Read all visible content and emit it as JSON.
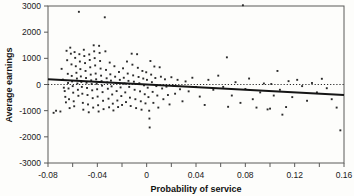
{
  "chart_data": {
    "type": "scatter",
    "title": "",
    "xlabel": "Probability of service",
    "ylabel": "Average earnings",
    "xlim": [
      -0.08,
      0.16
    ],
    "ylim": [
      -3000,
      3000
    ],
    "grid": false,
    "legend": "none",
    "x_ticks": [
      -0.08,
      -0.04,
      0,
      0.04,
      0.08,
      0.12,
      0.16
    ],
    "x_tick_labels": [
      "-0.08",
      "-0.04",
      "0",
      "0.04",
      "0.08",
      "0.12",
      "0.16"
    ],
    "x_minor_ticks": [
      -0.06,
      -0.02,
      0.02,
      0.06,
      0.1,
      0.14
    ],
    "y_ticks": [
      -3000,
      -2000,
      -1000,
      0,
      1000,
      2000,
      3000
    ],
    "y_tick_labels": [
      "-3000",
      "-2000",
      "-1000",
      "0",
      "1000",
      "2000",
      "3000"
    ],
    "annotations": [
      {
        "name": "zero-reference-line",
        "type": "hline",
        "y": 0,
        "style": "dotted"
      },
      {
        "name": "regression-line",
        "type": "line",
        "x0": -0.08,
        "y0": 200,
        "x1": 0.16,
        "y1": -400,
        "style": "solid"
      }
    ],
    "series": [
      {
        "name": "earnings-vs-probability",
        "marker": "point",
        "points": [
          [
            -0.0755,
            -1080
          ],
          [
            -0.0735,
            -1000
          ],
          [
            -0.07,
            -1030
          ],
          [
            -0.069,
            600
          ],
          [
            -0.068,
            190
          ],
          [
            -0.0672,
            -120
          ],
          [
            -0.0665,
            -250
          ],
          [
            -0.066,
            -470
          ],
          [
            -0.0655,
            -680
          ],
          [
            -0.065,
            1290
          ],
          [
            -0.0645,
            930
          ],
          [
            -0.064,
            410
          ],
          [
            -0.0638,
            60
          ],
          [
            -0.0634,
            -150
          ],
          [
            -0.063,
            -560
          ],
          [
            -0.0625,
            -900
          ],
          [
            -0.062,
            1410
          ],
          [
            -0.0615,
            1180
          ],
          [
            -0.061,
            770
          ],
          [
            -0.0608,
            330
          ],
          [
            -0.0605,
            120
          ],
          [
            -0.06,
            -60
          ],
          [
            -0.0596,
            -310
          ],
          [
            -0.0592,
            -640
          ],
          [
            -0.0588,
            -830
          ],
          [
            -0.0585,
            1240
          ],
          [
            -0.058,
            1020
          ],
          [
            -0.0575,
            700
          ],
          [
            -0.057,
            450
          ],
          [
            -0.0566,
            230
          ],
          [
            -0.0562,
            40
          ],
          [
            -0.0558,
            -200
          ],
          [
            -0.0554,
            -430
          ],
          [
            -0.055,
            2780
          ],
          [
            -0.0546,
            1160
          ],
          [
            -0.0542,
            880
          ],
          [
            -0.0538,
            590
          ],
          [
            -0.0534,
            310
          ],
          [
            -0.053,
            100
          ],
          [
            -0.0526,
            -90
          ],
          [
            -0.0522,
            -350
          ],
          [
            -0.0518,
            -700
          ],
          [
            -0.0514,
            -960
          ],
          [
            -0.051,
            1330
          ],
          [
            -0.0506,
            1090
          ],
          [
            -0.05,
            820
          ],
          [
            -0.0496,
            520
          ],
          [
            -0.0492,
            250
          ],
          [
            -0.0488,
            70
          ],
          [
            -0.0484,
            -130
          ],
          [
            -0.048,
            -400
          ],
          [
            -0.0476,
            -760
          ],
          [
            -0.047,
            -1060
          ],
          [
            -0.0466,
            1150
          ],
          [
            -0.0462,
            940
          ],
          [
            -0.0458,
            660
          ],
          [
            -0.0454,
            380
          ],
          [
            -0.045,
            160
          ],
          [
            -0.0446,
            20
          ],
          [
            -0.0442,
            -220
          ],
          [
            -0.0438,
            -520
          ],
          [
            -0.0434,
            -880
          ],
          [
            -0.043,
            1500
          ],
          [
            -0.0426,
            1270
          ],
          [
            -0.0422,
            1010
          ],
          [
            -0.0418,
            730
          ],
          [
            -0.0414,
            420
          ],
          [
            -0.041,
            200
          ],
          [
            -0.0406,
            30
          ],
          [
            -0.0402,
            -180
          ],
          [
            -0.0398,
            -460
          ],
          [
            -0.0394,
            -790
          ],
          [
            -0.039,
            -1030
          ],
          [
            -0.0386,
            1480
          ],
          [
            -0.0382,
            1210
          ],
          [
            -0.0378,
            900
          ],
          [
            -0.0374,
            610
          ],
          [
            -0.037,
            340
          ],
          [
            -0.0366,
            130
          ],
          [
            -0.0362,
            -40
          ],
          [
            -0.0358,
            -290
          ],
          [
            -0.0354,
            -620
          ],
          [
            -0.035,
            -940
          ],
          [
            -0.034,
            2570
          ],
          [
            -0.0335,
            1270
          ],
          [
            -0.033,
            560
          ],
          [
            -0.0325,
            240
          ],
          [
            -0.032,
            80
          ],
          [
            -0.0315,
            -160
          ],
          [
            -0.031,
            -540
          ],
          [
            -0.0305,
            -870
          ],
          [
            -0.03,
            840
          ],
          [
            -0.0295,
            390
          ],
          [
            -0.029,
            150
          ],
          [
            -0.0285,
            -70
          ],
          [
            -0.028,
            -380
          ],
          [
            -0.0275,
            -730
          ],
          [
            -0.027,
            -990
          ],
          [
            -0.0262,
            700
          ],
          [
            -0.0256,
            300
          ],
          [
            -0.025,
            60
          ],
          [
            -0.0244,
            -250
          ],
          [
            -0.0238,
            -610
          ],
          [
            -0.0232,
            -860
          ],
          [
            -0.0225,
            480
          ],
          [
            -0.0218,
            180
          ],
          [
            -0.0212,
            -110
          ],
          [
            -0.0206,
            -440
          ],
          [
            -0.02,
            -780
          ],
          [
            -0.0192,
            620
          ],
          [
            -0.0186,
            260
          ],
          [
            -0.018,
            40
          ],
          [
            -0.0174,
            -300
          ],
          [
            -0.0168,
            -670
          ],
          [
            -0.016,
            880
          ],
          [
            -0.0154,
            420
          ],
          [
            -0.0148,
            140
          ],
          [
            -0.0142,
            -90
          ],
          [
            -0.0136,
            -500
          ],
          [
            -0.013,
            -820
          ],
          [
            -0.0122,
            1180
          ],
          [
            -0.0116,
            760
          ],
          [
            -0.011,
            350
          ],
          [
            -0.0104,
            110
          ],
          [
            -0.0098,
            -200
          ],
          [
            -0.0092,
            -560
          ],
          [
            -0.0086,
            -900
          ],
          [
            -0.0078,
            1160
          ],
          [
            -0.0072,
            640
          ],
          [
            -0.0066,
            290
          ],
          [
            -0.006,
            50
          ],
          [
            -0.0054,
            -260
          ],
          [
            -0.0048,
            -640
          ],
          [
            -0.0042,
            -960
          ],
          [
            -0.0035,
            520
          ],
          [
            -0.0028,
            230
          ],
          [
            -0.0022,
            -30
          ],
          [
            -0.0016,
            -370
          ],
          [
            -0.001,
            -720
          ],
          [
            -0.0004,
            470
          ],
          [
            0.0002,
            180
          ],
          [
            0.0008,
            -120
          ],
          [
            0.0014,
            -480
          ],
          [
            0.002,
            -1000
          ],
          [
            0.0022,
            -1300
          ],
          [
            0.0024,
            -1640
          ],
          [
            0.003,
            900
          ],
          [
            0.0036,
            380
          ],
          [
            0.0042,
            90
          ],
          [
            0.0048,
            -280
          ],
          [
            0.0054,
            -700
          ],
          [
            0.0062,
            690
          ],
          [
            0.007,
            250
          ],
          [
            0.0078,
            -60
          ],
          [
            0.0086,
            -420
          ],
          [
            0.0094,
            -880
          ],
          [
            0.0105,
            660
          ],
          [
            0.0115,
            300
          ],
          [
            0.0125,
            -150
          ],
          [
            0.0135,
            -560
          ],
          [
            0.0148,
            200
          ],
          [
            0.016,
            -80
          ],
          [
            0.0172,
            -400
          ],
          [
            0.0185,
            -760
          ],
          [
            0.02,
            280
          ],
          [
            0.0215,
            -40
          ],
          [
            0.023,
            -350
          ],
          [
            0.025,
            180
          ],
          [
            0.027,
            -180
          ],
          [
            0.029,
            -640
          ],
          [
            0.0315,
            120
          ],
          [
            0.034,
            -260
          ],
          [
            0.037,
            260
          ],
          [
            0.04,
            -90
          ],
          [
            0.043,
            -460
          ],
          [
            0.047,
            -780
          ],
          [
            0.05,
            180
          ],
          [
            0.054,
            -200
          ],
          [
            0.058,
            340
          ],
          [
            0.062,
            -90
          ],
          [
            0.065,
            1040
          ],
          [
            0.066,
            -850
          ],
          [
            0.069,
            -420
          ],
          [
            0.072,
            90
          ],
          [
            0.076,
            -700
          ],
          [
            0.078,
            3030
          ],
          [
            0.08,
            -170
          ],
          [
            0.083,
            230
          ],
          [
            0.086,
            -560
          ],
          [
            0.089,
            -880
          ],
          [
            0.092,
            -300
          ],
          [
            0.095,
            40
          ],
          [
            0.098,
            -950
          ],
          [
            0.1,
            -920
          ],
          [
            0.101,
            20
          ],
          [
            0.103,
            -420
          ],
          [
            0.106,
            520
          ],
          [
            0.108,
            -200
          ],
          [
            0.11,
            -1150
          ],
          [
            0.113,
            -860
          ],
          [
            0.115,
            130
          ],
          [
            0.118,
            -480
          ],
          [
            0.122,
            180
          ],
          [
            0.126,
            -60
          ],
          [
            0.13,
            -620
          ],
          [
            0.134,
            60
          ],
          [
            0.138,
            -300
          ],
          [
            0.142,
            220
          ],
          [
            0.146,
            -140
          ],
          [
            0.15,
            -560
          ],
          [
            0.154,
            -880
          ],
          [
            0.157,
            -1750
          ]
        ]
      }
    ]
  },
  "axes": {
    "x_title": "Probability of service",
    "y_title": "Average earnings"
  }
}
